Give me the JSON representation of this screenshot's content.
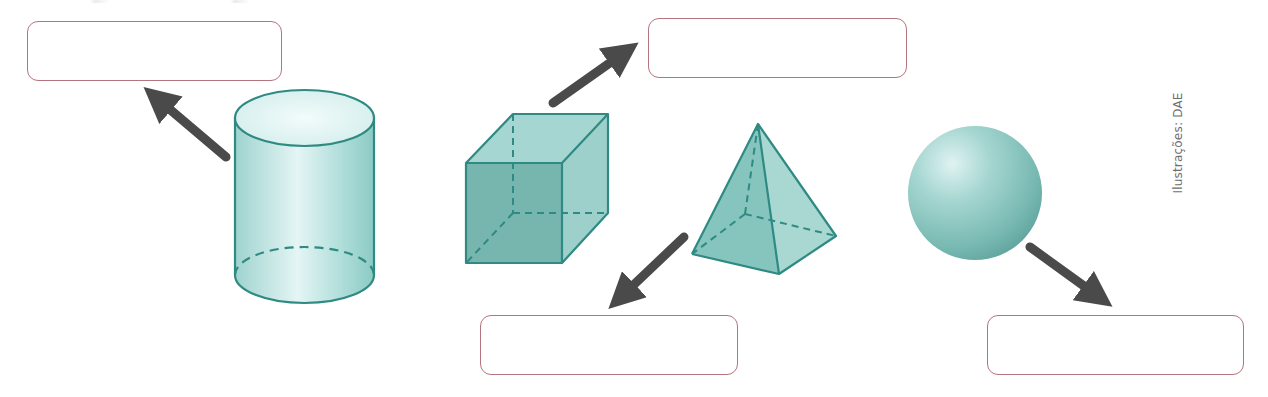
{
  "exercise": {
    "instruction": "",
    "credit": "Ilustrações: DAE"
  },
  "colors": {
    "solid_stroke": "#2e8a82",
    "solid_fill_light": "#cfeceb",
    "solid_fill_mid": "#8fcbc6",
    "solid_fill_dark": "#6fb0a9",
    "arrow": "#4a4a4a",
    "box_border": "#b5747e"
  },
  "shapes": [
    {
      "id": "cylinder",
      "name": "cylinder",
      "answer_box": 0
    },
    {
      "id": "cube",
      "name": "cube",
      "answer_box": 1
    },
    {
      "id": "pyramid",
      "name": "square pyramid",
      "answer_box": 2
    },
    {
      "id": "sphere",
      "name": "sphere",
      "answer_box": 3
    }
  ],
  "answer_boxes": [
    {
      "value": "",
      "placeholder": ""
    },
    {
      "value": "",
      "placeholder": ""
    },
    {
      "value": "",
      "placeholder": ""
    },
    {
      "value": "",
      "placeholder": ""
    }
  ]
}
